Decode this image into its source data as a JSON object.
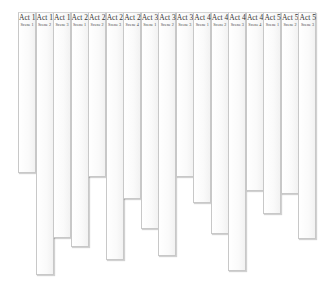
{
  "chart_data": {
    "type": "bar",
    "title": "",
    "xlabel": "",
    "ylabel": "",
    "orientation": "vertical-hanging",
    "grid": false,
    "legend": "none",
    "categories": [
      {
        "act": "Act 1",
        "scene": "Scene 1"
      },
      {
        "act": "Act 1",
        "scene": "Scene 2"
      },
      {
        "act": "Act 1",
        "scene": "Scene 3"
      },
      {
        "act": "Act 2",
        "scene": "Scene 1"
      },
      {
        "act": "Act 2",
        "scene": "Scene 2"
      },
      {
        "act": "Act 2",
        "scene": "Scene 3"
      },
      {
        "act": "Act 2",
        "scene": "Scene 4"
      },
      {
        "act": "Act 3",
        "scene": "Scene 1"
      },
      {
        "act": "Act 3",
        "scene": "Scene 2"
      },
      {
        "act": "Act 3",
        "scene": "Scene 3"
      },
      {
        "act": "Act 4",
        "scene": "Scene 1"
      },
      {
        "act": "Act 4",
        "scene": "Scene 2"
      },
      {
        "act": "Act 4",
        "scene": "Scene 3"
      },
      {
        "act": "Act 4",
        "scene": "Scene 4"
      },
      {
        "act": "Act 5",
        "scene": "Scene 1"
      },
      {
        "act": "Act 5",
        "scene": "Scene 2"
      },
      {
        "act": "Act 5",
        "scene": "Scene 3"
      }
    ],
    "values": [
      161,
      263,
      226,
      235,
      165,
      248,
      187,
      217,
      244,
      165,
      191,
      222,
      259,
      179,
      202,
      182,
      227
    ],
    "value_unit": "relative length",
    "ylim": [
      0,
      265
    ]
  }
}
